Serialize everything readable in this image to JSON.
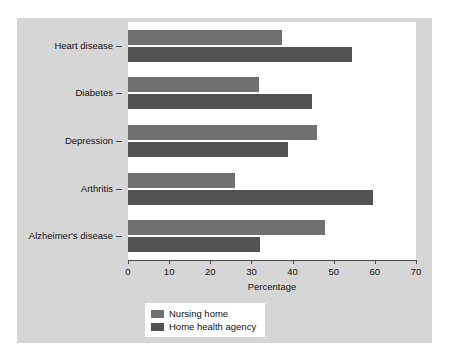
{
  "chart_data": {
    "type": "bar",
    "orientation": "horizontal",
    "title": "",
    "xlabel": "Percentage",
    "ylabel": "",
    "xlim": [
      0,
      70
    ],
    "xticks": [
      0,
      10,
      20,
      30,
      40,
      50,
      60,
      70
    ],
    "grid": false,
    "legend_position": "bottom-center",
    "categories": [
      "Heart disease",
      "Diabetes",
      "Depression",
      "Arthritis",
      "Alzheimer's disease"
    ],
    "series": [
      {
        "name": "Nursing home",
        "color": "#707070",
        "values": [
          37.5,
          31.8,
          46.0,
          26.0,
          48.0
        ]
      },
      {
        "name": "Home health agency",
        "color": "#525252",
        "values": [
          54.5,
          44.8,
          39.0,
          59.5,
          32.0
        ]
      }
    ]
  },
  "figure": {
    "background": "#d6d6d6",
    "plot_background": "#ffffff"
  }
}
